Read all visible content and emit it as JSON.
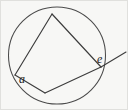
{
  "figure": {
    "kind": "geometry-diagram",
    "width": 128,
    "height": 110,
    "background_color": "#f7f7f5",
    "stroke_color": "#3c3c3c",
    "label_color": "#1e1e1e",
    "circle": {
      "name": "circle",
      "cx": 57,
      "cy": 55.5,
      "r": 48.5
    },
    "vertices": [
      {
        "id": "top",
        "x": 52,
        "y": 14
      },
      {
        "id": "left",
        "x": 15,
        "y": 75
      },
      {
        "id": "bottom",
        "x": 45,
        "y": 93
      },
      {
        "id": "right",
        "x": 101,
        "y": 67
      }
    ],
    "chords": [
      {
        "id": "top-left",
        "from": "top",
        "to": "left",
        "d": "M 52 14 L 15 75"
      },
      {
        "id": "left-bottom",
        "from": "left",
        "to": "bottom",
        "d": "M 15 75 L 45 93"
      },
      {
        "id": "bottom-right",
        "from": "bottom",
        "to": "right",
        "d": "M 45 93 L 101 67"
      },
      {
        "id": "right-top",
        "from": "right",
        "to": "top",
        "d": "M 101 67 L 52 14"
      }
    ],
    "ray": {
      "id": "exterior-ray",
      "from": "right",
      "d": "M 101 67 L 126 52"
    },
    "labels": [
      {
        "id": "a",
        "text": "a",
        "x": 19,
        "y": 73,
        "at_vertex": "left"
      },
      {
        "id": "e",
        "text": "e",
        "x": 97,
        "y": 53,
        "at_vertex": "right"
      }
    ]
  }
}
